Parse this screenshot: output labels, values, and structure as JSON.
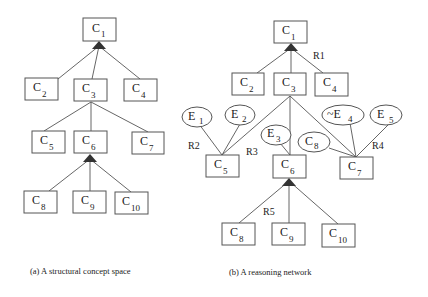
{
  "figure_a": {
    "caption": "(a) A structural concept space",
    "nodes": [
      {
        "id": "C1",
        "main": "C",
        "sub": "1"
      },
      {
        "id": "C2",
        "main": "C",
        "sub": "2"
      },
      {
        "id": "C3",
        "main": "C",
        "sub": "3"
      },
      {
        "id": "C4",
        "main": "C",
        "sub": "4"
      },
      {
        "id": "C5",
        "main": "C",
        "sub": "5"
      },
      {
        "id": "C6",
        "main": "C",
        "sub": "6"
      },
      {
        "id": "C7",
        "main": "C",
        "sub": "7"
      },
      {
        "id": "C8",
        "main": "C",
        "sub": "8"
      },
      {
        "id": "C9",
        "main": "C",
        "sub": "9"
      },
      {
        "id": "C10",
        "main": "C",
        "sub": "10"
      }
    ],
    "edges": [
      [
        "C1",
        "C2"
      ],
      [
        "C1",
        "C3"
      ],
      [
        "C1",
        "C4"
      ],
      [
        "C3",
        "C5"
      ],
      [
        "C3",
        "C6"
      ],
      [
        "C3",
        "C7"
      ],
      [
        "C6",
        "C8"
      ],
      [
        "C6",
        "C9"
      ],
      [
        "C6",
        "C10"
      ]
    ]
  },
  "figure_b": {
    "caption": "(b) A reasoning network",
    "concepts": [
      {
        "id": "C1",
        "main": "C",
        "sub": "1"
      },
      {
        "id": "C2",
        "main": "C",
        "sub": "2"
      },
      {
        "id": "C3",
        "main": "C",
        "sub": "3"
      },
      {
        "id": "C4",
        "main": "C",
        "sub": "4"
      },
      {
        "id": "C5",
        "main": "C",
        "sub": "5"
      },
      {
        "id": "C6",
        "main": "C",
        "sub": "6"
      },
      {
        "id": "C7",
        "main": "C",
        "sub": "7"
      },
      {
        "id": "C8b",
        "main": "C",
        "sub": "8"
      },
      {
        "id": "C9",
        "main": "C",
        "sub": "9"
      },
      {
        "id": "C10",
        "main": "C",
        "sub": "10"
      }
    ],
    "evidence": [
      {
        "id": "E1",
        "main": "E",
        "sub": "1"
      },
      {
        "id": "E2",
        "main": "E",
        "sub": "2"
      },
      {
        "id": "E3",
        "main": "E",
        "sub": "3"
      },
      {
        "id": "C8e",
        "main": "C",
        "sub": "8"
      },
      {
        "id": "nE4",
        "main": "~E",
        "sub": "4"
      },
      {
        "id": "E5",
        "main": "E",
        "sub": "5"
      }
    ],
    "rules": [
      "R1",
      "R2",
      "R3",
      "R4",
      "R5"
    ]
  }
}
